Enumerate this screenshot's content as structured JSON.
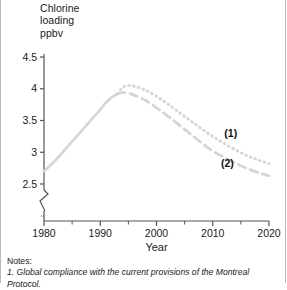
{
  "figure": {
    "y_axis_title": "Chlorine\nloading\nppbv",
    "x_axis_title": "Year",
    "notes_heading": "Notes:",
    "notes_item_1": "1.  Global compliance with the current provisions of the Montreal Protocol.",
    "series_label_1": "(1)",
    "series_label_2": "(2)",
    "colors": {
      "curve": "#d5d5d5",
      "axis": "#555555",
      "text": "#1a1a1a",
      "frame": "#b9b9b9"
    }
  },
  "chart_data": {
    "type": "line",
    "title": "",
    "xlabel": "Year",
    "ylabel": "Chlorine loading ppbv",
    "xlim": [
      1980,
      2020
    ],
    "ylim": [
      2.4,
      4.5
    ],
    "y_axis_break": true,
    "y_axis_break_below": 2.5,
    "grid": false,
    "legend_position": "inline-annotation",
    "xticks": [
      1980,
      1990,
      2000,
      2010,
      2020
    ],
    "xtick_labels": [
      "1980",
      "1990",
      "2000",
      "2010",
      "2020"
    ],
    "xminor_ticks": [
      1985,
      1995,
      2005,
      2015
    ],
    "yticks": [
      2.5,
      3,
      3.5,
      4,
      4.5
    ],
    "ytick_labels": [
      "2.5",
      "3",
      "3.5",
      "4",
      "4.5"
    ],
    "annotations": [
      {
        "text": "(1)",
        "x": 2013.2,
        "y": 3.24
      },
      {
        "text": "(2)",
        "x": 2012.6,
        "y": 2.77
      }
    ],
    "series": [
      {
        "name": "historical",
        "style": "solid",
        "x": [
          1980,
          1982,
          1984,
          1986,
          1988,
          1990,
          1991,
          1992,
          1993
        ],
        "values": [
          2.7,
          2.87,
          3.07,
          3.27,
          3.47,
          3.67,
          3.78,
          3.86,
          3.92
        ]
      },
      {
        "name": "(1)",
        "style": "dotted",
        "x": [
          1993,
          1994,
          1995,
          1996,
          1998,
          2000,
          2002,
          2004,
          2006,
          2008,
          2010,
          2012,
          2014,
          2016,
          2018,
          2020
        ],
        "values": [
          3.92,
          4.02,
          4.05,
          4.04,
          3.98,
          3.88,
          3.76,
          3.63,
          3.5,
          3.37,
          3.25,
          3.14,
          3.04,
          2.95,
          2.88,
          2.82
        ]
      },
      {
        "name": "(2)",
        "style": "dashed",
        "x": [
          1993,
          1994,
          1995,
          1996,
          1998,
          2000,
          2002,
          2004,
          2006,
          2008,
          2010,
          2012,
          2014,
          2016,
          2018,
          2020
        ],
        "values": [
          3.92,
          3.94,
          3.93,
          3.9,
          3.82,
          3.7,
          3.57,
          3.43,
          3.29,
          3.15,
          3.02,
          2.92,
          2.83,
          2.75,
          2.68,
          2.63
        ]
      }
    ]
  }
}
